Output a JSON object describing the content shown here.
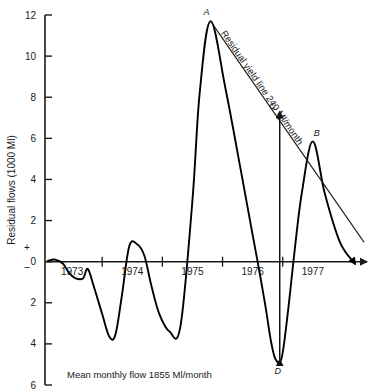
{
  "chart_data": {
    "type": "line",
    "title": "",
    "subtitle": "",
    "xlabel": "",
    "ylabel": "Residual flows (1000 Ml)",
    "caption": "Mean monthly flow 1855 Ml/month",
    "grid": false,
    "legend": "none",
    "xlim": [
      1972.55,
      1977.9
    ],
    "ylim": [
      -6,
      12
    ],
    "ytick_labels": [
      "12",
      "10",
      "8",
      "6",
      "4",
      "2",
      "0",
      "2",
      "4",
      "6"
    ],
    "ytick_values": [
      12,
      10,
      8,
      6,
      4,
      2,
      0,
      -2,
      -4,
      -6
    ],
    "xtick_labels": [
      "1973",
      "1974",
      "1975",
      "1976",
      "1977"
    ],
    "xtick_values": [
      1973,
      1974,
      1975,
      1976,
      1977
    ],
    "sign_positive": "+",
    "sign_negative": "–",
    "series": [
      {
        "name": "Residual mass curve",
        "x": [
          1972.6,
          1972.72,
          1972.85,
          1972.95,
          1973.05,
          1973.18,
          1973.26,
          1973.36,
          1973.5,
          1973.62,
          1973.72,
          1973.83,
          1973.95,
          1974.08,
          1974.2,
          1974.32,
          1974.45,
          1974.62,
          1974.8,
          1975.0,
          1975.12,
          1975.3,
          1975.55,
          1975.8,
          1976.0,
          1976.12,
          1976.22,
          1976.3,
          1976.38,
          1976.48,
          1976.58,
          1976.7,
          1976.82,
          1977.0,
          1977.2,
          1977.45,
          1977.7
        ],
        "y": [
          0.05,
          0.1,
          -0.1,
          -0.55,
          -0.8,
          -0.82,
          -0.35,
          -1.2,
          -2.55,
          -3.65,
          -3.55,
          -1.6,
          0.75,
          0.85,
          0.3,
          -1.2,
          -2.55,
          -3.4,
          -3.15,
          3.0,
          8.2,
          11.7,
          8.4,
          4.5,
          1.3,
          -0.6,
          -2.3,
          -3.8,
          -4.75,
          -4.7,
          -2.6,
          0.6,
          3.4,
          5.85,
          3.3,
          0.95,
          -0.1
        ]
      }
    ],
    "reference_line": {
      "name": "Residual yield line 240 Ml/month",
      "label": "Residual yield line 240 Ml/month",
      "x": [
        1975.3,
        1977.85
      ],
      "y": [
        11.7,
        0.95
      ]
    },
    "annotations": [
      {
        "id": "A",
        "label": "A",
        "x": 1975.3,
        "y": 11.7
      },
      {
        "id": "B",
        "label": "B",
        "x": 1977.0,
        "y": 5.85
      },
      {
        "id": "C",
        "label": "C",
        "x": 1976.48,
        "y": 7.4
      },
      {
        "id": "D",
        "label": "D",
        "x": 1976.4,
        "y": -4.9
      }
    ],
    "measure_arrow": {
      "name": "C-D residual range arrow",
      "from": {
        "x": 1976.45,
        "y": -4.75
      },
      "to": {
        "x": 1976.45,
        "y": 7.3
      }
    },
    "colors": {
      "curve": "#000000",
      "axis": "#1a1a1a",
      "yield_line": "#1a1a1a",
      "background": "#ffffff"
    }
  }
}
